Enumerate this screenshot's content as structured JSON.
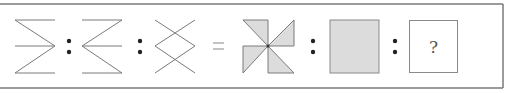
{
  "puzzle": {
    "type": "visual-analogy",
    "left_group": {
      "figures": [
        {
          "id": "fig1",
          "description": "three horizontal lines with zigzag converging to right vertex"
        },
        {
          "id": "fig2",
          "description": "three horizontal lines with zigzag converging to left vertex"
        },
        {
          "id": "fig3",
          "description": "crossed lines forming a diamond with X crossings top and bottom"
        }
      ],
      "separators": [
        ":",
        ":"
      ]
    },
    "equals": "=",
    "right_group": {
      "figures": [
        {
          "id": "fig4",
          "description": "pinwheel of four shaded right triangles"
        },
        {
          "id": "fig5",
          "description": "solid shaded square"
        },
        {
          "id": "fig6",
          "description": "answer box",
          "label": "?"
        }
      ],
      "separators": [
        ":",
        ":"
      ]
    },
    "colors": {
      "line": "#7a7a7a",
      "fill": "#dcdcdc",
      "border": "#8a8a8a",
      "dot": "#222222"
    }
  }
}
